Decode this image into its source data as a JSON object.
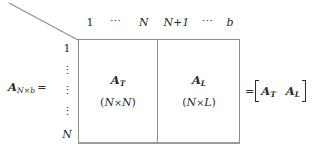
{
  "figure": {
    "type": "block-partitioned-matrix-diagram",
    "colors": {
      "background": "#ffffff",
      "box_border": "#8d8d8d",
      "text": "#2b2b2b",
      "diagonal_line": "#8d8d8d"
    }
  },
  "column_headers": {
    "left_block": {
      "first": "1",
      "ellipsis": "⋯",
      "last": "N"
    },
    "right_block": {
      "first": "N+1",
      "ellipsis": "⋯",
      "last": "b"
    }
  },
  "row_labels": {
    "first": "1",
    "vdots_1": "⋮",
    "vdots_2": "⋮",
    "vdots_3": "⋮",
    "last": "N"
  },
  "lhs": {
    "symbol": "A",
    "subscript": "N×b",
    "equals": "="
  },
  "blocks": [
    {
      "symbol": "A",
      "subscript": "T",
      "dimension_open": "(",
      "dimension_left": "N",
      "dimension_times": "×",
      "dimension_right": "N",
      "dimension_close": ")"
    },
    {
      "symbol": "A",
      "subscript": "L",
      "dimension_open": "(",
      "dimension_left": "N",
      "dimension_times": "×",
      "dimension_right": "L",
      "dimension_close": ")"
    }
  ],
  "rhs": {
    "equals": "=",
    "bracket_open": "[",
    "first_symbol": "A",
    "first_subscript": "T",
    "second_symbol": "A",
    "second_subscript": "L",
    "bracket_close": "]"
  }
}
